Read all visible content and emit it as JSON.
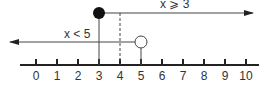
{
  "diagram": {
    "type": "number-line",
    "axis": {
      "min": 0,
      "max": 10,
      "ticks": [
        "0",
        "1",
        "2",
        "3",
        "4",
        "5",
        "6",
        "7",
        "8",
        "9",
        "10"
      ]
    },
    "inequalities": [
      {
        "label": "x ⩾ 3",
        "endpoint": 3,
        "endpoint_style": "filled",
        "direction": "right"
      },
      {
        "label": "x < 5",
        "endpoint": 5,
        "endpoint_style": "open",
        "direction": "left"
      }
    ],
    "dashed_marker_at": 4,
    "colors": {
      "line": "#333333",
      "dot": "#111111",
      "background": "#ffffff"
    }
  }
}
